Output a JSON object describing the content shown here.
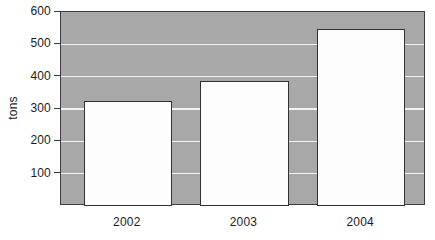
{
  "chart_data": {
    "type": "bar",
    "title": "",
    "subtitle": "",
    "xlabel": "",
    "ylabel": "tons",
    "categories": [
      "2002",
      "2003",
      "2004"
    ],
    "values": [
      320,
      380,
      540
    ],
    "series": [
      {
        "name": "tons",
        "values": [
          320,
          380,
          540
        ]
      }
    ],
    "ylim": [
      0,
      600
    ],
    "yticks": [
      100,
      200,
      300,
      400,
      500,
      600
    ],
    "ytick_labels": [
      "100",
      "200",
      "300",
      "400",
      "500",
      "600"
    ],
    "grid": true,
    "grid_axis": "y",
    "legend": false,
    "legend_position": "none",
    "annotations": [],
    "colors": {
      "plot_background": "#a8a8a8",
      "gridline": "#f2f2f2",
      "bar_fill": "#fdfdfd",
      "bar_border": "#323232",
      "axis_border": "#3d3d3d",
      "text": "#1b1b1b",
      "page_background": "#ffffff"
    }
  }
}
